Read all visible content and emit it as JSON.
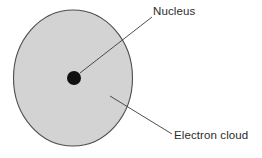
{
  "diagram": {
    "type": "atom-structure-diagram",
    "background_color": "#ffffff",
    "electron_cloud": {
      "label": "Electron cloud",
      "shape": "ellipse",
      "fill_color": "#d3d3d3",
      "stroke_color": "#4d4d4d",
      "center_x": 73,
      "center_y": 78,
      "radius_x": 60,
      "radius_y": 68.5
    },
    "nucleus": {
      "label": "Nucleus",
      "shape": "circle",
      "fill_color": "#111111",
      "center_x": 74,
      "center_y": 78,
      "radius": 7
    },
    "leaders": [
      {
        "name": "nucleus-leader",
        "target": "Nucleus",
        "x1": 80,
        "y1": 73,
        "x2": 152,
        "y2": 17,
        "color": "#3a3a3a"
      },
      {
        "name": "electron-cloud-leader",
        "target": "Electron cloud",
        "x1": 110,
        "y1": 96,
        "x2": 172,
        "y2": 134,
        "color": "#3a3a3a"
      }
    ],
    "labels": {
      "nucleus": "Nucleus",
      "electron_cloud": "Electron cloud",
      "text_color": "#2b2b2b"
    }
  }
}
